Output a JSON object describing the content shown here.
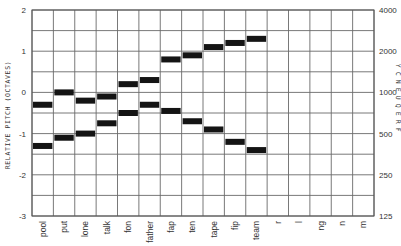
{
  "chart_data": {
    "type": "bar",
    "subtype": "range-bar (formant chart)",
    "title": "",
    "ylabel": "RELATIVE PITCH (OCTAVES)",
    "ylabel_right": "FREQUENCY",
    "ylim": [
      -3,
      2
    ],
    "y_ticks": [
      2,
      1,
      0,
      -1,
      -2,
      -3
    ],
    "y_ticks_right": [
      "4000",
      "2000",
      "1000",
      "500",
      "250",
      "125"
    ],
    "grid": true,
    "grid_step": 0.5,
    "legend": null,
    "categories": [
      "pool",
      "put",
      "lone",
      "talk",
      "fon",
      "father",
      "fap",
      "ten",
      "tape",
      "fip",
      "team",
      "r",
      "l",
      "ng",
      "n",
      "m"
    ],
    "series": [
      {
        "name": "vowel formants (narrow bars)",
        "bars": [
          {
            "category": "pool",
            "values": [
              -0.3,
              -1.3
            ]
          },
          {
            "category": "put",
            "values": [
              0.0,
              -1.1
            ]
          },
          {
            "category": "lone",
            "values": [
              -0.2,
              -1.0
            ]
          },
          {
            "category": "talk",
            "values": [
              -0.1,
              -0.75
            ]
          },
          {
            "category": "fon",
            "values": [
              0.2,
              -0.5
            ]
          },
          {
            "category": "father",
            "values": [
              0.3,
              -0.3
            ]
          },
          {
            "category": "fap",
            "values": [
              0.8,
              -0.45
            ]
          },
          {
            "category": "ten",
            "values": [
              0.9,
              -0.7
            ]
          },
          {
            "category": "tape",
            "values": [
              1.1,
              -0.9
            ]
          },
          {
            "category": "fip",
            "values": [
              1.2,
              -1.2
            ]
          },
          {
            "category": "team",
            "values": [
              1.3,
              -1.4
            ]
          }
        ]
      },
      {
        "name": "consonant resonance bands (wide blocks)",
        "blocks": [
          {
            "category": "r",
            "ranges": [
              [
                0.9,
                1.3
              ],
              [
                0.0,
                0.35
              ],
              [
                -0.9,
                -0.5
              ]
            ]
          },
          {
            "category": "l",
            "ranges": [
              [
                1.2,
                1.6
              ],
              [
                -1.85,
                -1.5
              ]
            ]
          },
          {
            "category": "ng",
            "ranges": [
              [
                1.2,
                1.4
              ],
              [
                -0.7,
                -0.55
              ],
              [
                -2.3,
                -1.95
              ]
            ]
          },
          {
            "category": "n",
            "ranges": [
              [
                0.75,
                1.05
              ],
              [
                -0.7,
                -0.55
              ],
              [
                -2.35,
                -2.0
              ]
            ]
          },
          {
            "category": "m",
            "ranges": [
              [
                0.4,
                0.75
              ],
              [
                -0.7,
                -0.55
              ],
              [
                -2.1,
                -1.75
              ]
            ]
          }
        ]
      }
    ]
  }
}
